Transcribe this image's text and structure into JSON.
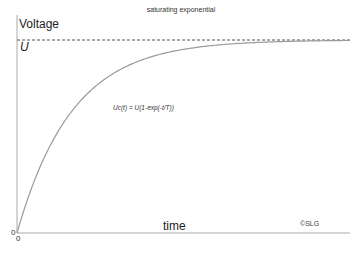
{
  "chart_data": {
    "type": "line",
    "title": "saturating exponential",
    "xlabel": "time",
    "ylabel": "Voltage",
    "annotations": [
      "U",
      "Uc(t) = U(1-exp(-t/T))",
      "©SLG"
    ],
    "asymptote": {
      "label": "U",
      "style": "dashed",
      "value": 1.0
    },
    "series": [
      {
        "name": "Uc(t)",
        "x": [
          0,
          0.5,
          1,
          1.5,
          2,
          2.5,
          3,
          4,
          5,
          6
        ],
        "values": [
          0,
          0.393,
          0.632,
          0.777,
          0.865,
          0.918,
          0.95,
          0.982,
          0.993,
          0.998
        ]
      }
    ],
    "x_origin_label": "0",
    "y_origin_label": "0",
    "xlim": [
      0,
      6
    ],
    "ylim": [
      0,
      1
    ],
    "grid": false,
    "color": "#999999"
  },
  "labels": {
    "title": "saturating exponential",
    "ylabel": "Voltage",
    "u": "U",
    "formula": "Uc(t) = U(1-exp(-t/T))",
    "xlabel": "time",
    "credit": "©SLG",
    "zero_y": "0",
    "zero_x": "0"
  }
}
